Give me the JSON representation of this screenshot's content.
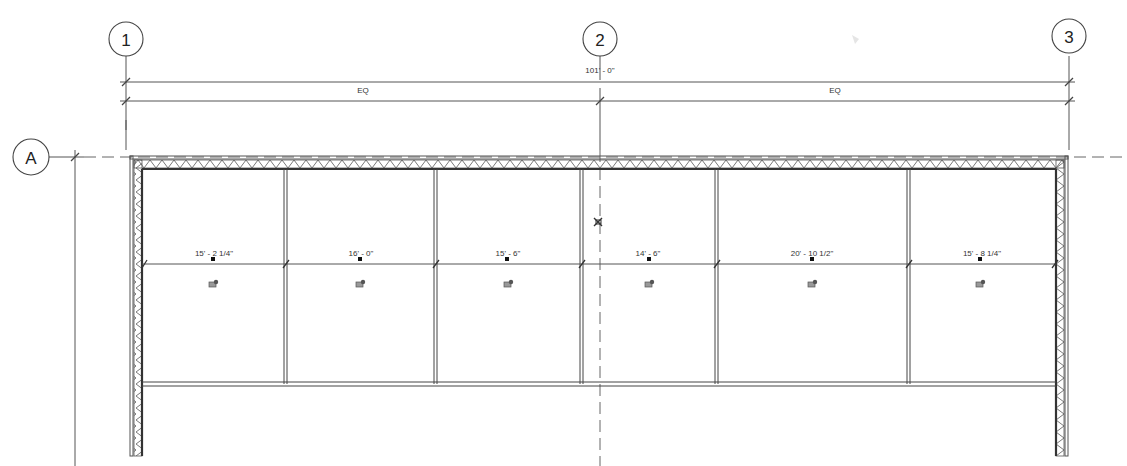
{
  "drawing": {
    "type": "floor-plan",
    "grids": {
      "vertical": [
        {
          "label": "1",
          "x": 126
        },
        {
          "label": "2",
          "x": 600
        },
        {
          "label": "3",
          "x": 1069
        }
      ],
      "horizontal": [
        {
          "label": "A",
          "y": 157
        }
      ]
    },
    "overall_dimension": {
      "label": "101' - 0\""
    },
    "eq_dimensions": [
      {
        "label": "EQ"
      },
      {
        "label": "EQ"
      }
    ],
    "rooms": [
      {
        "width_label": "15' - 2 1/4\"",
        "x1": 143,
        "x2": 285
      },
      {
        "width_label": "16' - 0\"",
        "x1": 285,
        "x2": 435
      },
      {
        "width_label": "15' - 6\"",
        "x1": 435,
        "x2": 581
      },
      {
        "width_label": "14' - 6\"",
        "x1": 581,
        "x2": 716
      },
      {
        "width_label": "20' - 10 1/2\"",
        "x1": 716,
        "x2": 908
      },
      {
        "width_label": "15' - 8 1/4\"",
        "x1": 908,
        "x2": 1056
      }
    ],
    "colors": {
      "line": "#555555",
      "text": "#333333",
      "background": "#ffffff"
    }
  }
}
